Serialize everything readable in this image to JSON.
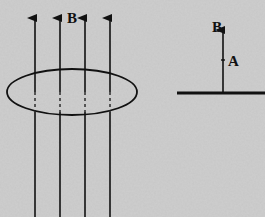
{
  "figure": {
    "left_panel": {
      "field_label": "B",
      "field_line_count": 4,
      "loop_description": "circular loop seen in perspective, field lines passing through"
    },
    "right_panel": {
      "vector_label": "B",
      "area_label": "A",
      "surface_description": "edge-on view of loop surface with field vector perpendicular"
    },
    "colors": {
      "background": "#c9c9c9",
      "ink": "#111111"
    }
  }
}
